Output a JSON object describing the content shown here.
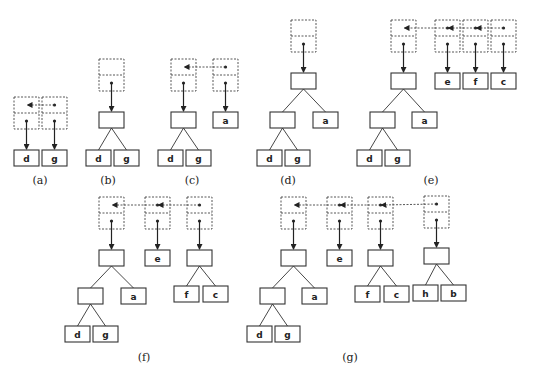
{
  "figure": {
    "colors": {
      "stroke": "#333333",
      "background": "#ffffff"
    },
    "panels": [
      {
        "id": "a",
        "caption": "(a)",
        "caption_pos": [
          40,
          184
        ],
        "cells": [
          {
            "x": 14,
            "y": 97
          },
          {
            "x": 42,
            "y": 97
          }
        ],
        "links": [
          [
            1,
            0
          ]
        ],
        "nodes": [
          {
            "x": 14,
            "y": 150,
            "label": "d"
          },
          {
            "x": 42,
            "y": 150,
            "label": "g"
          }
        ],
        "edges": [],
        "pointers": [
          [
            0,
            0
          ],
          [
            1,
            1
          ]
        ]
      },
      {
        "id": "b",
        "caption": "(b)",
        "caption_pos": [
          108,
          184
        ],
        "cells": [
          {
            "x": 99,
            "y": 59
          }
        ],
        "links": [],
        "nodes": [
          {
            "x": 99,
            "y": 112,
            "label": ""
          },
          {
            "x": 86,
            "y": 150,
            "label": "d"
          },
          {
            "x": 114,
            "y": 150,
            "label": "g"
          }
        ],
        "edges": [
          [
            0,
            1
          ],
          [
            0,
            2
          ]
        ],
        "pointers": [
          [
            0,
            0
          ]
        ]
      },
      {
        "id": "c",
        "caption": "(c)",
        "caption_pos": [
          192,
          184
        ],
        "cells": [
          {
            "x": 171,
            "y": 59
          },
          {
            "x": 213,
            "y": 59
          }
        ],
        "links": [
          [
            1,
            0
          ]
        ],
        "nodes": [
          {
            "x": 171,
            "y": 112,
            "label": ""
          },
          {
            "x": 158,
            "y": 150,
            "label": "d"
          },
          {
            "x": 186,
            "y": 150,
            "label": "g"
          },
          {
            "x": 213,
            "y": 112,
            "label": "a"
          }
        ],
        "edges": [
          [
            0,
            1
          ],
          [
            0,
            2
          ]
        ],
        "pointers": [
          [
            0,
            0
          ],
          [
            1,
            3
          ]
        ]
      },
      {
        "id": "d",
        "caption": "(d)",
        "caption_pos": [
          288,
          184
        ],
        "cells": [
          {
            "x": 291,
            "y": 20
          }
        ],
        "links": [],
        "nodes": [
          {
            "x": 291,
            "y": 73,
            "label": ""
          },
          {
            "x": 270,
            "y": 112,
            "label": ""
          },
          {
            "x": 313,
            "y": 112,
            "label": "a"
          },
          {
            "x": 257,
            "y": 150,
            "label": "d"
          },
          {
            "x": 285,
            "y": 150,
            "label": "g"
          }
        ],
        "edges": [
          [
            0,
            1
          ],
          [
            0,
            2
          ],
          [
            1,
            3
          ],
          [
            1,
            4
          ]
        ],
        "pointers": [
          [
            0,
            0
          ]
        ]
      },
      {
        "id": "e",
        "caption": "(e)",
        "caption_pos": [
          431,
          184
        ],
        "cells": [
          {
            "x": 391,
            "y": 20
          },
          {
            "x": 435,
            "y": 20
          },
          {
            "x": 463,
            "y": 20
          },
          {
            "x": 491,
            "y": 20
          }
        ],
        "links": [
          [
            3,
            2
          ],
          [
            2,
            1
          ],
          [
            1,
            0
          ]
        ],
        "nodes": [
          {
            "x": 391,
            "y": 73,
            "label": ""
          },
          {
            "x": 370,
            "y": 112,
            "label": ""
          },
          {
            "x": 412,
            "y": 112,
            "label": "a"
          },
          {
            "x": 357,
            "y": 150,
            "label": "d"
          },
          {
            "x": 385,
            "y": 150,
            "label": "g"
          },
          {
            "x": 435,
            "y": 73,
            "label": "e"
          },
          {
            "x": 463,
            "y": 73,
            "label": "f"
          },
          {
            "x": 491,
            "y": 73,
            "label": "c"
          }
        ],
        "edges": [
          [
            0,
            1
          ],
          [
            0,
            2
          ],
          [
            1,
            3
          ],
          [
            1,
            4
          ]
        ],
        "pointers": [
          [
            0,
            0
          ],
          [
            1,
            5
          ],
          [
            2,
            6
          ],
          [
            3,
            7
          ]
        ]
      },
      {
        "id": "f",
        "caption": "(f)",
        "caption_pos": [
          144,
          361
        ],
        "cells": [
          {
            "x": 99,
            "y": 197
          },
          {
            "x": 145,
            "y": 197
          },
          {
            "x": 187,
            "y": 197
          }
        ],
        "links": [
          [
            2,
            1
          ],
          [
            1,
            0
          ]
        ],
        "nodes": [
          {
            "x": 99,
            "y": 250,
            "label": ""
          },
          {
            "x": 78,
            "y": 288,
            "label": ""
          },
          {
            "x": 121,
            "y": 288,
            "label": "a"
          },
          {
            "x": 65,
            "y": 326,
            "label": "d"
          },
          {
            "x": 93,
            "y": 326,
            "label": "g"
          },
          {
            "x": 145,
            "y": 250,
            "label": "e"
          },
          {
            "x": 187,
            "y": 250,
            "label": ""
          },
          {
            "x": 174,
            "y": 286,
            "label": "f"
          },
          {
            "x": 203,
            "y": 286,
            "label": "c"
          }
        ],
        "edges": [
          [
            0,
            1
          ],
          [
            0,
            2
          ],
          [
            1,
            3
          ],
          [
            1,
            4
          ],
          [
            6,
            7
          ],
          [
            6,
            8
          ]
        ],
        "pointers": [
          [
            0,
            0
          ],
          [
            1,
            5
          ],
          [
            2,
            6
          ]
        ]
      },
      {
        "id": "g",
        "caption": "(g)",
        "caption_pos": [
          350,
          361
        ],
        "cells": [
          {
            "x": 281,
            "y": 197
          },
          {
            "x": 327,
            "y": 197
          },
          {
            "x": 368,
            "y": 197
          },
          {
            "x": 424,
            "y": 196
          }
        ],
        "links": [
          [
            3,
            2
          ],
          [
            2,
            1
          ],
          [
            1,
            0
          ]
        ],
        "nodes": [
          {
            "x": 281,
            "y": 250,
            "label": ""
          },
          {
            "x": 260,
            "y": 288,
            "label": ""
          },
          {
            "x": 302,
            "y": 288,
            "label": "a"
          },
          {
            "x": 247,
            "y": 326,
            "label": "d"
          },
          {
            "x": 275,
            "y": 326,
            "label": "g"
          },
          {
            "x": 327,
            "y": 250,
            "label": "e"
          },
          {
            "x": 368,
            "y": 250,
            "label": ""
          },
          {
            "x": 355,
            "y": 286,
            "label": "f"
          },
          {
            "x": 384,
            "y": 286,
            "label": "c"
          },
          {
            "x": 424,
            "y": 248,
            "label": ""
          },
          {
            "x": 413,
            "y": 285,
            "label": "h"
          },
          {
            "x": 441,
            "y": 285,
            "label": "b"
          }
        ],
        "edges": [
          [
            0,
            1
          ],
          [
            0,
            2
          ],
          [
            1,
            3
          ],
          [
            1,
            4
          ],
          [
            6,
            7
          ],
          [
            6,
            8
          ],
          [
            9,
            10
          ],
          [
            9,
            11
          ]
        ],
        "pointers": [
          [
            0,
            0
          ],
          [
            1,
            5
          ],
          [
            2,
            6
          ],
          [
            3,
            9
          ]
        ]
      }
    ]
  }
}
